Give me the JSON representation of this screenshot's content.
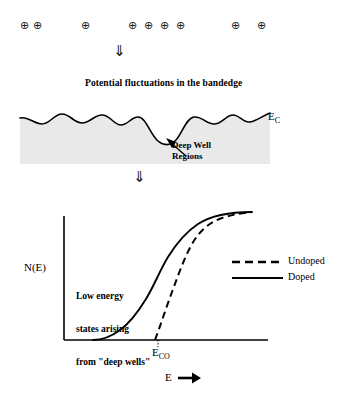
{
  "charges": {
    "symbol": "⊕",
    "count": 9,
    "positions_x": [
      20,
      33,
      81,
      128,
      144,
      160,
      176,
      231,
      257
    ],
    "position_y": 20
  },
  "arrows": {
    "symbol": "⇓",
    "first": {
      "x": 113,
      "y": 44
    },
    "second": {
      "x": 133,
      "y": 170
    }
  },
  "caption": {
    "text": "Potential fluctuations in the bandedge",
    "x": 85,
    "y": 78
  },
  "band": {
    "ec_label": "E",
    "ec_subscript": "C",
    "deep_well_line1": "Deep Well",
    "deep_well_line2": "Regions",
    "shade_color": "#e9e9e9",
    "line_color": "#000000"
  },
  "plot": {
    "y_axis_label": "N(E)",
    "x_axis_label": "E",
    "x_axis_arrow": "➡",
    "threshold_label": "E",
    "threshold_subscript": "CO",
    "note_line1": "Low energy",
    "note_line2": "states arising",
    "note_line3": "from \"deep wells\"",
    "legend": [
      {
        "label": "Undoped",
        "style": "dashed"
      },
      {
        "label": "Doped",
        "style": "solid"
      }
    ]
  },
  "chart_data": {
    "type": "line",
    "xlabel": "E",
    "ylabel": "N(E)",
    "xlim": [
      0,
      1
    ],
    "ylim": [
      0,
      1
    ],
    "grid": false,
    "legend_position": "right",
    "annotations": [
      "Low energy states arising from \"deep wells\"",
      "E_CO"
    ],
    "series": [
      {
        "name": "Undoped",
        "style": "dashed",
        "comment": "sharp band edge onset at E_CO, square-root-like rise then saturation",
        "x": [
          0.0,
          0.05,
          0.1,
          0.15,
          0.2,
          0.25,
          0.3,
          0.35,
          0.4,
          0.45,
          0.44,
          0.46,
          0.5,
          0.55,
          0.6,
          0.65,
          0.7,
          0.75,
          0.8,
          0.85,
          0.9,
          0.95,
          1.0
        ],
        "y": [
          0.0,
          0.0,
          0.0,
          0.0,
          0.0,
          0.0,
          0.0,
          0.0,
          0.0,
          0.0,
          0.0,
          0.06,
          0.26,
          0.45,
          0.62,
          0.75,
          0.84,
          0.9,
          0.94,
          0.96,
          0.98,
          0.99,
          1.0
        ]
      },
      {
        "name": "Doped",
        "style": "solid",
        "comment": "band tail extends below E_CO due to deep well states",
        "x": [
          0.0,
          0.05,
          0.1,
          0.15,
          0.2,
          0.25,
          0.3,
          0.35,
          0.4,
          0.45,
          0.5,
          0.55,
          0.6,
          0.65,
          0.7,
          0.75,
          0.8,
          0.85,
          0.9,
          0.95,
          1.0
        ],
        "y": [
          0.0,
          0.0,
          0.0,
          0.01,
          0.03,
          0.07,
          0.13,
          0.21,
          0.31,
          0.42,
          0.53,
          0.64,
          0.73,
          0.81,
          0.87,
          0.91,
          0.94,
          0.96,
          0.98,
          0.99,
          1.0
        ]
      }
    ],
    "markers": [
      {
        "name": "E_CO",
        "x": 0.45,
        "y": 0.0
      }
    ]
  }
}
